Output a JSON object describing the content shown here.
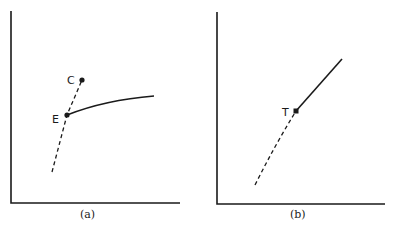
{
  "panels": [
    {
      "id": "a",
      "caption": "(a)",
      "points": [
        {
          "label": "C",
          "x": 82,
          "y": 80
        },
        {
          "label": "E",
          "x": 67,
          "y": 115
        }
      ],
      "dashed_line": "from below through E up to C",
      "solid_curve": "from E rising and flattening to the right"
    },
    {
      "id": "b",
      "caption": "(b)",
      "points": [
        {
          "label": "T",
          "x": 296,
          "y": 111
        }
      ],
      "dashed_line": "from lower left curving up to T",
      "solid_curve": "straight line from T up to the upper right"
    }
  ],
  "colors": {
    "ink": "#1a1a1a",
    "background": "#ffffff"
  }
}
